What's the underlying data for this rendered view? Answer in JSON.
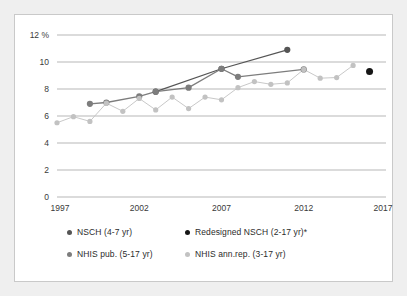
{
  "figure": {
    "background_color": "#ffffff",
    "border_color": "#c9c9c9",
    "page_background": "#efefef"
  },
  "chart_data": {
    "type": "line",
    "title": "",
    "subtitle": "",
    "xlabel": "",
    "ylabel": "",
    "y_axis_unit_label": "12 %",
    "xlim": [
      1997,
      2017
    ],
    "ylim": [
      0,
      12
    ],
    "grid": "horizontal",
    "legend_position": "bottom",
    "yticks": [
      0,
      2,
      4,
      6,
      8,
      10,
      12
    ],
    "ytick_labels": [
      "0",
      "2",
      "4",
      "6",
      "8",
      "10",
      "12 %"
    ],
    "xticks": [
      1997,
      2002,
      2007,
      2012,
      2017
    ],
    "xtick_labels": [
      "1997",
      "2002",
      "2007",
      "2012",
      "2017"
    ],
    "series": [
      {
        "name": "NSCH (4-7 yr)",
        "color": "#555555",
        "connected": true,
        "marker": "circle",
        "points": [
          {
            "x": 2003,
            "y": 7.8
          },
          {
            "x": 2007,
            "y": 9.5
          },
          {
            "x": 2011,
            "y": 10.9
          }
        ]
      },
      {
        "name": "Redesigned NSCH (2-17 yr)*",
        "color": "#161616",
        "connected": false,
        "marker": "circle",
        "points": [
          {
            "x": 2016,
            "y": 9.3
          }
        ]
      },
      {
        "name": "NHIS pub. (5-17 yr)",
        "color": "#7d7d7d",
        "connected": true,
        "marker": "circle",
        "points": [
          {
            "x": 1999,
            "y": 6.9
          },
          {
            "x": 2000,
            "y": 7.0
          },
          {
            "x": 2002,
            "y": 7.45
          },
          {
            "x": 2003,
            "y": 7.8
          },
          {
            "x": 2005,
            "y": 8.1
          },
          {
            "x": 2007,
            "y": 9.5
          },
          {
            "x": 2008,
            "y": 8.9
          },
          {
            "x": 2012,
            "y": 9.45
          }
        ]
      },
      {
        "name": "NHIS ann.rep. (3-17 yr)",
        "color": "#c2c2c2",
        "connected": true,
        "marker": "circle",
        "points": [
          {
            "x": 1997,
            "y": 5.5
          },
          {
            "x": 1998,
            "y": 5.95
          },
          {
            "x": 1999,
            "y": 5.6
          },
          {
            "x": 2000,
            "y": 6.95
          },
          {
            "x": 2001,
            "y": 6.35
          },
          {
            "x": 2002,
            "y": 7.3
          },
          {
            "x": 2003,
            "y": 6.45
          },
          {
            "x": 2004,
            "y": 7.4
          },
          {
            "x": 2005,
            "y": 6.55
          },
          {
            "x": 2006,
            "y": 7.4
          },
          {
            "x": 2007,
            "y": 7.2
          },
          {
            "x": 2008,
            "y": 8.1
          },
          {
            "x": 2009,
            "y": 8.55
          },
          {
            "x": 2010,
            "y": 8.35
          },
          {
            "x": 2011,
            "y": 8.45
          },
          {
            "x": 2012,
            "y": 9.45
          },
          {
            "x": 2013,
            "y": 8.8
          },
          {
            "x": 2014,
            "y": 8.85
          },
          {
            "x": 2015,
            "y": 9.75
          }
        ]
      }
    ]
  },
  "legend": {
    "items": [
      {
        "label": "NSCH (4-7 yr)",
        "color": "#555555"
      },
      {
        "label": "Redesigned NSCH (2-17 yr)*",
        "color": "#161616"
      },
      {
        "label": "NHIS pub. (5-17 yr)",
        "color": "#7d7d7d"
      },
      {
        "label": "NHIS ann.rep. (3-17 yr)",
        "color": "#c2c2c2"
      }
    ]
  }
}
